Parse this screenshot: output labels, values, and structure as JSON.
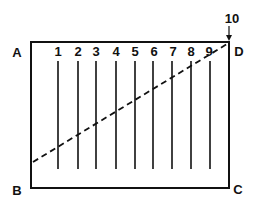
{
  "diagram": {
    "corners": {
      "A": "A",
      "B": "B",
      "C": "C",
      "D": "D"
    },
    "line_numbers": [
      "1",
      "2",
      "3",
      "4",
      "5",
      "6",
      "7",
      "8",
      "9"
    ],
    "top_label": "10",
    "colors": {
      "stroke": "#111111",
      "background": "#ffffff"
    }
  }
}
